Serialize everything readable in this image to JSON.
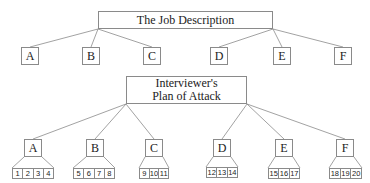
{
  "top_tree": {
    "title": "The Job Description",
    "title_box": {
      "x": 98,
      "y": 11,
      "w": 175,
      "h": 18
    },
    "root_left_anchor": [
      98,
      29
    ],
    "root_right_anchor": [
      273,
      29
    ],
    "children": [
      {
        "label": "A",
        "x": 21,
        "y": 47,
        "w": 18,
        "h": 18,
        "anchor": "left"
      },
      {
        "label": "B",
        "x": 82,
        "y": 47,
        "w": 18,
        "h": 18,
        "anchor": "left"
      },
      {
        "label": "C",
        "x": 143,
        "y": 47,
        "w": 18,
        "h": 18,
        "anchor": "left"
      },
      {
        "label": "D",
        "x": 210,
        "y": 47,
        "w": 18,
        "h": 18,
        "anchor": "right"
      },
      {
        "label": "E",
        "x": 273,
        "y": 47,
        "w": 18,
        "h": 18,
        "anchor": "right"
      },
      {
        "label": "F",
        "x": 334,
        "y": 47,
        "w": 18,
        "h": 18,
        "anchor": "right"
      }
    ]
  },
  "bottom_tree": {
    "title_lines": [
      "Interviewer's",
      "Plan of Attack"
    ],
    "title_box": {
      "x": 126,
      "y": 76,
      "w": 121,
      "h": 28
    },
    "root_left_anchor": [
      126,
      104
    ],
    "root_right_anchor": [
      247,
      104
    ],
    "children": [
      {
        "label": "A",
        "x": 24,
        "y": 139,
        "w": 18,
        "h": 18,
        "anchor": "left",
        "numbers": [
          "1",
          "2",
          "3",
          "4"
        ],
        "row": {
          "x": 12,
          "y": 168,
          "w": 42
        }
      },
      {
        "label": "B",
        "x": 86,
        "y": 139,
        "w": 18,
        "h": 18,
        "anchor": "left",
        "numbers": [
          "5",
          "6",
          "7",
          "8"
        ],
        "row": {
          "x": 73,
          "y": 168,
          "w": 42
        }
      },
      {
        "label": "C",
        "x": 145,
        "y": 139,
        "w": 18,
        "h": 18,
        "anchor": "left",
        "numbers": [
          "9",
          "10",
          "11"
        ],
        "row": {
          "x": 139,
          "y": 168,
          "w": 30
        }
      },
      {
        "label": "D",
        "x": 213,
        "y": 139,
        "w": 18,
        "h": 18,
        "anchor": "right",
        "numbers": [
          "12",
          "13",
          "14"
        ],
        "row": {
          "x": 206,
          "y": 167,
          "w": 32
        }
      },
      {
        "label": "E",
        "x": 275,
        "y": 139,
        "w": 18,
        "h": 18,
        "anchor": "right",
        "numbers": [
          "15",
          "16",
          "17"
        ],
        "row": {
          "x": 268,
          "y": 168,
          "w": 32
        }
      },
      {
        "label": "F",
        "x": 336,
        "y": 139,
        "w": 18,
        "h": 18,
        "anchor": "right",
        "numbers": [
          "18",
          "19",
          "20"
        ],
        "row": {
          "x": 329,
          "y": 168,
          "w": 33
        }
      }
    ]
  },
  "colors": {
    "line": "#8a8a8a",
    "text": "#222222",
    "background": "#ffffff"
  }
}
